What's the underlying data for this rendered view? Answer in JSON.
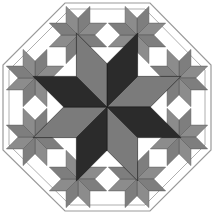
{
  "canvas": {
    "width": 214,
    "height": 215,
    "background": "#ffffff"
  },
  "colors": {
    "dark": "#2b2b2b",
    "medium": "#7b7b7b",
    "small_a": "#7e7e7e",
    "small_b": "#8c8c8c",
    "outline": "#9a9a9a",
    "seam": "#555555"
  },
  "octagon": {
    "outer": [
      [
        65,
        3
      ],
      [
        150,
        3
      ],
      [
        211,
        65
      ],
      [
        211,
        150
      ],
      [
        150,
        211
      ],
      [
        65,
        211
      ],
      [
        3,
        150
      ],
      [
        3,
        65
      ]
    ],
    "inner": [
      [
        70,
        9
      ],
      [
        145,
        9
      ],
      [
        205,
        70
      ],
      [
        205,
        145
      ],
      [
        145,
        205
      ],
      [
        70,
        205
      ],
      [
        9,
        145
      ],
      [
        9,
        70
      ]
    ]
  },
  "center_star": {
    "center": [
      107,
      107
    ],
    "petal_length": 80,
    "petal_colors": [
      "dark",
      "medium",
      "dark",
      "medium",
      "dark",
      "medium",
      "dark",
      "medium"
    ],
    "rotation_deg": 22.5
  },
  "small_stars": [
    {
      "center": [
        78,
        35
      ]
    },
    {
      "center": [
        137,
        35
      ]
    },
    {
      "center": [
        179,
        78
      ]
    },
    {
      "center": [
        179,
        137
      ]
    },
    {
      "center": [
        137,
        179
      ]
    },
    {
      "center": [
        78,
        179
      ]
    },
    {
      "center": [
        35,
        137
      ]
    },
    {
      "center": [
        35,
        78
      ]
    }
  ],
  "small_star": {
    "petal_length": 31
  }
}
